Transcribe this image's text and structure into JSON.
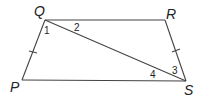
{
  "diagram": {
    "type": "geometry-trapezoid",
    "vertices": {
      "Q": {
        "label": "Q",
        "x": 45,
        "y": 20,
        "lx": 34,
        "ly": 16
      },
      "R": {
        "label": "R",
        "x": 165,
        "y": 20,
        "lx": 166,
        "ly": 19
      },
      "S": {
        "label": "S",
        "x": 186,
        "y": 81,
        "lx": 184,
        "ly": 95
      },
      "P": {
        "label": "P",
        "x": 22,
        "y": 80,
        "lx": 10,
        "ly": 92
      }
    },
    "segments": [
      "QR",
      "RS",
      "SP",
      "PQ",
      "QS"
    ],
    "angles": [
      {
        "label": "1",
        "x": 44,
        "y": 34
      },
      {
        "label": "2",
        "x": 74,
        "y": 31
      },
      {
        "label": "3",
        "x": 172,
        "y": 74
      },
      {
        "label": "4",
        "x": 150,
        "y": 78
      }
    ],
    "congruent_marks": [
      "PQ",
      "RS"
    ],
    "stroke_color": "#444444"
  }
}
